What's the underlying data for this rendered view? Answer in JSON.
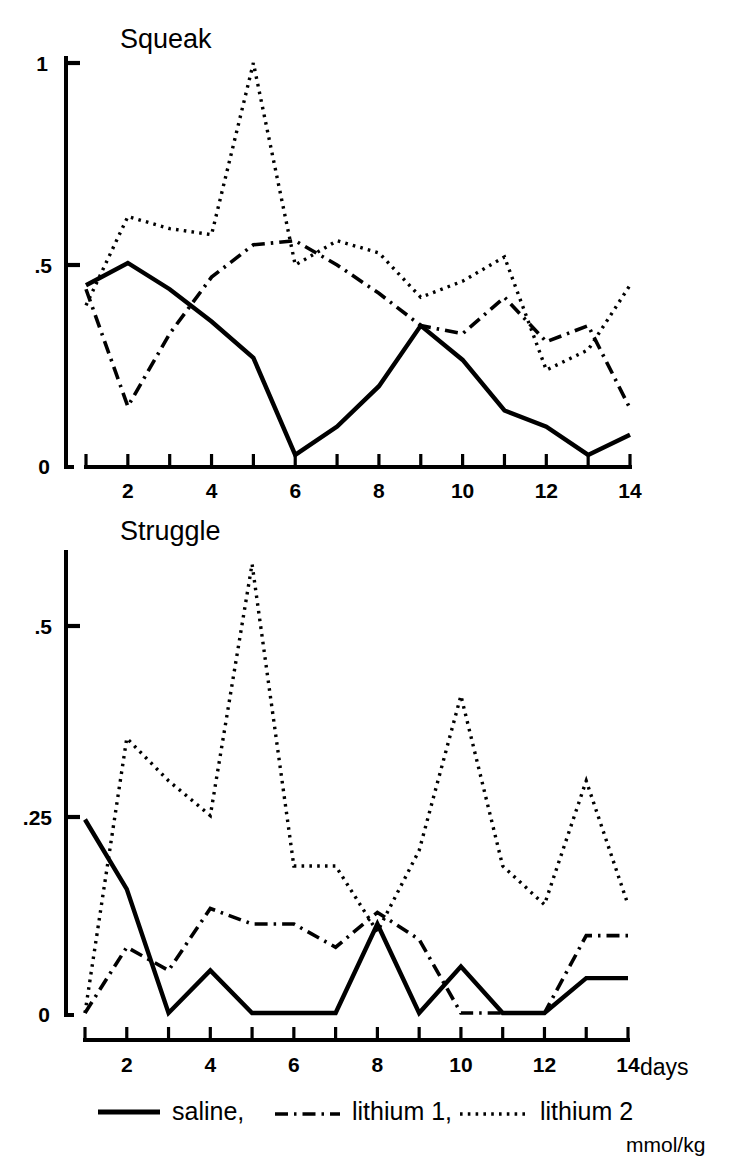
{
  "figure": {
    "units_label": "mmol/kg",
    "xaxis_title": "days"
  },
  "legend": {
    "items": [
      {
        "label": "saline,",
        "style": "solid",
        "name": "saline"
      },
      {
        "label": "lithium 1,",
        "style": "dash-dot",
        "name": "lithium-1"
      },
      {
        "label": "lithium 2",
        "style": "dotted",
        "name": "lithium-2"
      }
    ]
  },
  "chart_data": [
    {
      "type": "line",
      "title": "Squeak",
      "xlabel": "",
      "ylabel": "",
      "x": [
        1,
        2,
        3,
        4,
        5,
        6,
        7,
        8,
        9,
        10,
        11,
        12,
        13,
        14
      ],
      "xlim": [
        1,
        14
      ],
      "ylim": [
        0,
        1
      ],
      "xticks": [
        1,
        2,
        3,
        4,
        5,
        6,
        7,
        8,
        9,
        10,
        11,
        12,
        13,
        14
      ],
      "xticklabels": [
        "",
        "2",
        "",
        "4",
        "",
        "6",
        "",
        "8",
        "",
        "10",
        "",
        "12",
        "",
        "14"
      ],
      "yticks": [
        0,
        0.5,
        1
      ],
      "yticklabels": [
        "0",
        ".5",
        "1"
      ],
      "grid": false,
      "legend_position": "below-figure",
      "series": [
        {
          "name": "saline",
          "style": "solid",
          "values": [
            0.45,
            0.505,
            0.44,
            0.36,
            0.27,
            0.03,
            0.1,
            0.2,
            0.35,
            0.265,
            0.14,
            0.1,
            0.03,
            0.08
          ]
        },
        {
          "name": "lithium 1",
          "style": "dash-dot",
          "values": [
            0.44,
            0.15,
            0.33,
            0.47,
            0.55,
            0.56,
            0.5,
            0.43,
            0.35,
            0.33,
            0.42,
            0.31,
            0.35,
            0.145
          ]
        },
        {
          "name": "lithium 2",
          "style": "dotted",
          "values": [
            0.4,
            0.62,
            0.59,
            0.575,
            1.0,
            0.5,
            0.56,
            0.53,
            0.42,
            0.46,
            0.52,
            0.24,
            0.29,
            0.45
          ]
        }
      ]
    },
    {
      "type": "line",
      "title": "Struggle",
      "xlabel": "days",
      "ylabel": "",
      "x": [
        1,
        2,
        3,
        4,
        5,
        6,
        7,
        8,
        9,
        10,
        11,
        12,
        13,
        14
      ],
      "xlim": [
        1,
        14
      ],
      "ylim": [
        0,
        0.6
      ],
      "xticks": [
        1,
        2,
        3,
        4,
        5,
        6,
        7,
        8,
        9,
        10,
        11,
        12,
        13,
        14
      ],
      "xticklabels": [
        "",
        "2",
        "",
        "4",
        "",
        "6",
        "",
        "8",
        "",
        "10",
        "",
        "12",
        "",
        "14"
      ],
      "yticks": [
        0,
        0.25,
        0.5
      ],
      "yticklabels": [
        "0",
        ".25",
        ".5"
      ],
      "grid": false,
      "legend_position": "below-figure",
      "series": [
        {
          "name": "saline",
          "style": "solid",
          "values": [
            0.25,
            0.16,
            0.0,
            0.055,
            0.0,
            0.0,
            0.0,
            0.115,
            0.0,
            0.06,
            0.0,
            0.0,
            0.045,
            0.045
          ]
        },
        {
          "name": "lithium 1",
          "style": "dash-dot",
          "values": [
            0.0,
            0.085,
            0.055,
            0.135,
            0.115,
            0.115,
            0.085,
            0.13,
            0.095,
            0.0,
            0.0,
            0.0,
            0.1,
            0.1
          ]
        },
        {
          "name": "lithium 2",
          "style": "dotted",
          "values": [
            0.0,
            0.355,
            0.3,
            0.255,
            0.58,
            0.19,
            0.19,
            0.105,
            0.21,
            0.41,
            0.19,
            0.14,
            0.3,
            0.14
          ]
        }
      ]
    }
  ]
}
